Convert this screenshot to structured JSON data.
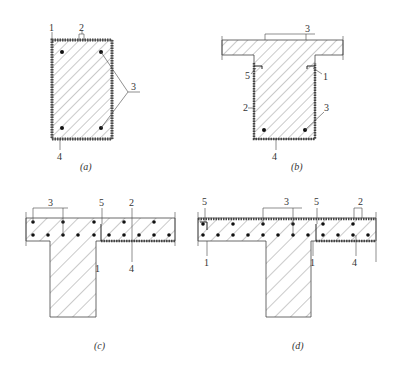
{
  "figure": {
    "panels": [
      {
        "id": "a",
        "caption": "(a)",
        "shape": "rectangular section",
        "labels": [
          "1",
          "2",
          "3",
          "4"
        ]
      },
      {
        "id": "b",
        "caption": "(b)",
        "shape": "T-section with flange",
        "labels": [
          "3",
          "5",
          "1",
          "2",
          "3",
          "4"
        ]
      },
      {
        "id": "c",
        "caption": "(c)",
        "shape": "inverted T / slab with edge beam",
        "labels": [
          "3",
          "5",
          "2",
          "1",
          "4"
        ]
      },
      {
        "id": "d",
        "caption": "(d)",
        "shape": "slab with beam, top and bottom strengthening",
        "labels": [
          "5",
          "3",
          "5",
          "2",
          "1",
          "1",
          "4"
        ]
      }
    ]
  },
  "a": {
    "caption": "(a)",
    "l1": "1",
    "l2": "2",
    "l3": "3",
    "l4": "4"
  },
  "b": {
    "caption": "(b)",
    "l3top": "3",
    "l5": "5",
    "l1": "1",
    "l2": "2",
    "l3": "3",
    "l4": "4"
  },
  "c": {
    "caption": "(c)",
    "l3": "3",
    "l5": "5",
    "l2": "2",
    "l1": "1",
    "l4": "4"
  },
  "d": {
    "caption": "(d)",
    "l5a": "5",
    "l3": "3",
    "l5b": "5",
    "l2": "2",
    "l1a": "1",
    "l1b": "1",
    "l4": "4"
  },
  "colors": {
    "line": "#444444",
    "hatch": "#666666",
    "layer": "#555555",
    "bar": "#111111"
  }
}
